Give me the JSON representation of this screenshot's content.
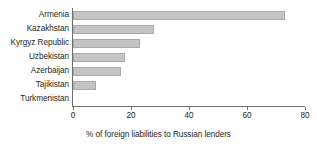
{
  "chart_data": {
    "type": "bar",
    "orientation": "horizontal",
    "title": "",
    "subtitle": "",
    "xlabel": "% of foreign liabilities to Russian lenders",
    "ylabel": "",
    "categories": [
      "Armenia",
      "Kazakhstan",
      "Kyrgyz Republic",
      "Uzbekistan",
      "Azerbaijan",
      "Tajikistan",
      "Turkmenistan"
    ],
    "values": [
      73,
      28,
      23,
      18,
      16.5,
      8,
      0
    ],
    "xlim": [
      0,
      80
    ],
    "xticks": [
      0,
      20,
      40,
      60,
      80
    ],
    "xtick_labels": [
      "0",
      "20",
      "40",
      "60",
      "80"
    ],
    "grid": false,
    "legend": false,
    "bar_color": "#c4c4c4",
    "bar_edge_color": "#a8a8a8",
    "axis_color": "#6d6e71",
    "text_color": "#231f20"
  }
}
